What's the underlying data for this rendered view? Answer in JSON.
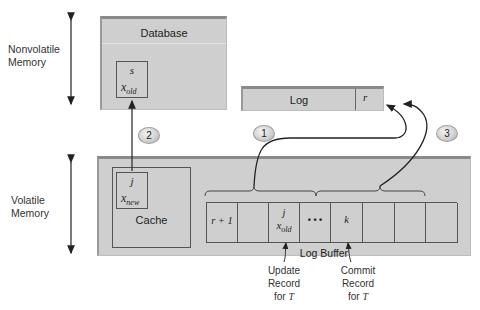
{
  "memory_labels": {
    "nonvolatile": "Nonvolatile\nMemory",
    "nonvolatile_line1": "Nonvolatile",
    "nonvolatile_line2": "Memory",
    "volatile_line1": "Volatile",
    "volatile_line2": "Memory"
  },
  "database": {
    "title": "Database",
    "record": {
      "id": "s",
      "value_base": "x",
      "value_sub": "old"
    }
  },
  "log": {
    "title": "Log",
    "last_record": "r"
  },
  "cache": {
    "title": "Cache",
    "record": {
      "id": "j",
      "value_base": "x",
      "value_sub": "new"
    }
  },
  "log_buffer": {
    "title": "Log Buffer",
    "cells": [
      {
        "id": "r + 1",
        "value_base": "",
        "value_sub": ""
      },
      {
        "id": "",
        "value_base": "",
        "value_sub": ""
      },
      {
        "id": "j",
        "value_base": "x",
        "value_sub": "old"
      },
      {
        "id": "• • •",
        "value_base": "",
        "value_sub": ""
      },
      {
        "id": "k",
        "value_base": "",
        "value_sub": ""
      },
      {
        "id": "",
        "value_base": "",
        "value_sub": ""
      },
      {
        "id": "",
        "value_base": "",
        "value_sub": ""
      },
      {
        "id": "",
        "value_base": "",
        "value_sub": ""
      }
    ]
  },
  "steps": [
    {
      "number": "1",
      "description": "Log buffer records flushed to log (first group)"
    },
    {
      "number": "2",
      "description": "Cache block written to database"
    },
    {
      "number": "3",
      "description": "Log buffer records flushed to log (second group)"
    }
  ],
  "annotations": {
    "update": {
      "line1": "Update",
      "line2": "Record",
      "line3_prefix": "for",
      "line3_var": "T"
    },
    "commit": {
      "line1": "Commit",
      "line2": "Record",
      "line3_prefix": "for",
      "line3_var": "T"
    }
  }
}
